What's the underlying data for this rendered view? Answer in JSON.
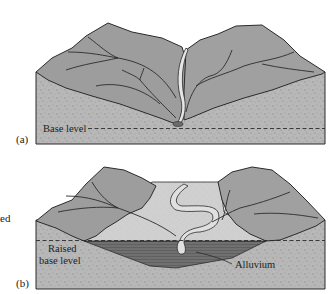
{
  "figure": {
    "panel_a": {
      "label": "(a)",
      "annotation_base_level": "Base level"
    },
    "panel_b": {
      "label": "(b)",
      "annotation_raised_line1": "Raised",
      "annotation_raised_line2": "base level",
      "annotation_alluvium": "Alluvium"
    },
    "cropped_side_text": "ed"
  },
  "colors": {
    "rock_fill": "#b4b4b4",
    "hill_fill": "#9a9a9a",
    "floodplain_fill": "#cfcfcf",
    "alluvium_fill": "#6e6e6e",
    "river_fill": "#e6e6e6",
    "outline": "#2b2b2b"
  }
}
